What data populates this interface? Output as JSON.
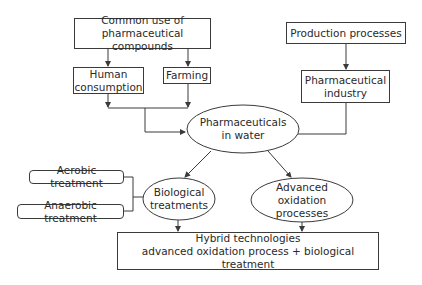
{
  "diagram": {
    "type": "flowchart",
    "nodes": {
      "common_use": {
        "line1": "Common use of",
        "line2": "pharmaceutical compounds",
        "shape": "rectangle"
      },
      "human_consumption": {
        "line1": "Human",
        "line2": "consumption",
        "shape": "rectangle"
      },
      "farming": {
        "label": "Farming",
        "shape": "rectangle"
      },
      "production_processes": {
        "label": "Production processes",
        "shape": "rectangle"
      },
      "pharmaceutical_industry": {
        "line1": "Pharmaceutical",
        "line2": "industry",
        "shape": "rectangle"
      },
      "pharmaceuticals_in_water": {
        "line1": "Pharmaceuticals",
        "line2": "in water",
        "shape": "ellipse"
      },
      "aerobic_treatment": {
        "label": "Aerobic treatment",
        "shape": "rounded-rectangle"
      },
      "anaerobic_treatment": {
        "label": "Anaerobic treatment",
        "shape": "rounded-rectangle"
      },
      "biological_treatments": {
        "line1": "Biological",
        "line2": "treatments",
        "shape": "ellipse"
      },
      "advanced_oxidation": {
        "line1": "Advanced",
        "line2": "oxidation processes",
        "shape": "ellipse"
      },
      "hybrid": {
        "line1": "Hybrid technologies",
        "line2": "advanced oxidation process + biological treatment",
        "shape": "rectangle"
      }
    },
    "edges": [
      {
        "from": "common_use",
        "to": "human_consumption"
      },
      {
        "from": "common_use",
        "to": "farming"
      },
      {
        "from": "human_consumption",
        "to": "pharmaceuticals_in_water"
      },
      {
        "from": "farming",
        "to": "pharmaceuticals_in_water"
      },
      {
        "from": "production_processes",
        "to": "pharmaceutical_industry"
      },
      {
        "from": "pharmaceutical_industry",
        "to": "pharmaceuticals_in_water"
      },
      {
        "from": "pharmaceuticals_in_water",
        "to": "biological_treatments"
      },
      {
        "from": "pharmaceuticals_in_water",
        "to": "advanced_oxidation"
      },
      {
        "from": "aerobic_treatment",
        "to": "biological_treatments",
        "style": "bracket"
      },
      {
        "from": "anaerobic_treatment",
        "to": "biological_treatments",
        "style": "bracket"
      },
      {
        "from": "biological_treatments",
        "to": "hybrid"
      },
      {
        "from": "advanced_oxidation",
        "to": "hybrid"
      }
    ],
    "colors": {
      "stroke": "#3a3a3a",
      "text": "#2a2a2a",
      "background": "#ffffff"
    }
  }
}
